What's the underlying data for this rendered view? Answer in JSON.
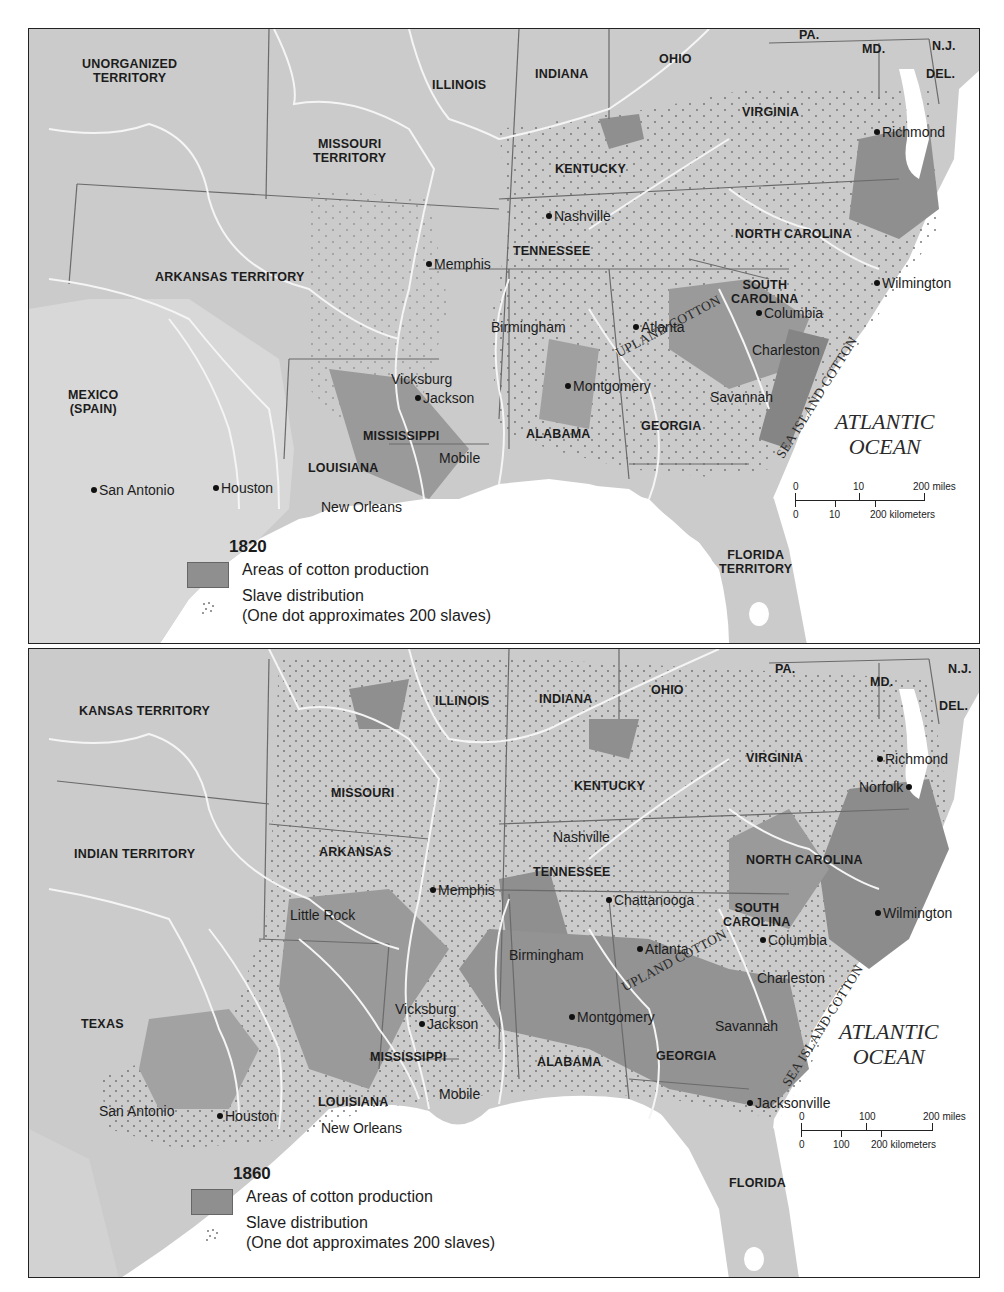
{
  "colors": {
    "land": "#c9c9c9",
    "land_light": "#d6d6d6",
    "cotton_area": "#8f8f8f",
    "water": "#ffffff",
    "river": "#f4f4f4",
    "border": "#6a6a6a",
    "frame": "#222222",
    "text": "#1c1c1c"
  },
  "maps": [
    {
      "year": "1820",
      "legend": {
        "year": "1820",
        "cotton_label": "Areas of cotton production",
        "slave_label": "Slave distribution",
        "slave_note": "(One dot approximates 200 slaves)"
      },
      "states": {
        "unorganized": "UNORGANIZED\nTERRITORY",
        "illinois": "ILLINOIS",
        "indiana": "INDIANA",
        "ohio": "OHIO",
        "pa": "PA.",
        "md": "MD.",
        "nj": "N.J.",
        "del": "DEL.",
        "missouri": "MISSOURI\nTERRITORY",
        "virginia": "VIRGINIA",
        "kentucky": "KENTUCKY",
        "tennessee": "TENNESSEE",
        "north_carolina": "NORTH CAROLINA",
        "arkansas": "ARKANSAS TERRITORY",
        "south_carolina": "SOUTH\nCAROLINA",
        "mexico": "MEXICO\n(SPAIN)",
        "mississippi": "MISSISSIPPI",
        "alabama": "ALABAMA",
        "georgia": "GEORGIA",
        "louisiana": "LOUISIANA",
        "florida": "FLORIDA\nTERRITORY"
      },
      "cities": {
        "richmond": "Richmond",
        "nashville": "Nashville",
        "memphis": "Memphis",
        "wilmington": "Wilmington",
        "columbia": "Columbia",
        "birmingham": "Birmingham",
        "atlanta": "Atlanta",
        "charleston": "Charleston",
        "vicksburg": "Vicksburg",
        "jackson": "Jackson",
        "montgomery": "Montgomery",
        "savannah": "Savannah",
        "mobile": "Mobile",
        "san_antonio": "San Antonio",
        "houston": "Houston",
        "new_orleans": "New Orleans"
      },
      "regions": {
        "upland": "UPLAND COTTON",
        "sea_island": "SEA ISLAND COTTON",
        "ocean": "ATLANTIC\nOCEAN"
      },
      "scale": {
        "miles_ticks": [
          "0",
          "10",
          "200 miles"
        ],
        "km_ticks": [
          "0",
          "10",
          "200 kilometers"
        ]
      }
    },
    {
      "year": "1860",
      "legend": {
        "year": "1860",
        "cotton_label": "Areas of cotton production",
        "slave_label": "Slave distribution",
        "slave_note": "(One dot approximates 200 slaves)"
      },
      "states": {
        "kansas": "KANSAS TERRITORY",
        "illinois": "ILLINOIS",
        "indiana": "INDIANA",
        "ohio": "OHIO",
        "pa": "PA.",
        "md": "MD.",
        "nj": "N.J.",
        "del": "DEL.",
        "missouri": "MISSOURI",
        "virginia": "VIRGINIA",
        "kentucky": "KENTUCKY",
        "indian": "INDIAN TERRITORY",
        "arkansas": "ARKANSAS",
        "tennessee": "TENNESSEE",
        "north_carolina": "NORTH CAROLINA",
        "south_carolina": "SOUTH\nCAROLINA",
        "texas": "TEXAS",
        "mississippi": "MISSISSIPPI",
        "alabama": "ALABAMA",
        "georgia": "GEORGIA",
        "louisiana": "LOUISIANA",
        "florida": "FLORIDA"
      },
      "cities": {
        "richmond": "Richmond",
        "norfolk": "Norfolk",
        "nashville": "Nashville",
        "memphis": "Memphis",
        "little_rock": "Little Rock",
        "chattanooga": "Chattanooga",
        "wilmington": "Wilmington",
        "columbia": "Columbia",
        "birmingham": "Birmingham",
        "atlanta": "Atlanta",
        "charleston": "Charleston",
        "vicksburg": "Vicksburg",
        "jackson": "Jackson",
        "montgomery": "Montgomery",
        "savannah": "Savannah",
        "mobile": "Mobile",
        "jacksonville": "Jacksonville",
        "san_antonio": "San Antonio",
        "houston": "Houston",
        "new_orleans": "New Orleans"
      },
      "regions": {
        "upland": "UPLAND COTTON",
        "sea_island": "SEA ISLAND COTTON",
        "ocean": "ATLANTIC\nOCEAN"
      },
      "scale": {
        "miles_ticks": [
          "0",
          "100",
          "200 miles"
        ],
        "km_ticks": [
          "0",
          "100",
          "200 kilometers"
        ]
      }
    }
  ]
}
